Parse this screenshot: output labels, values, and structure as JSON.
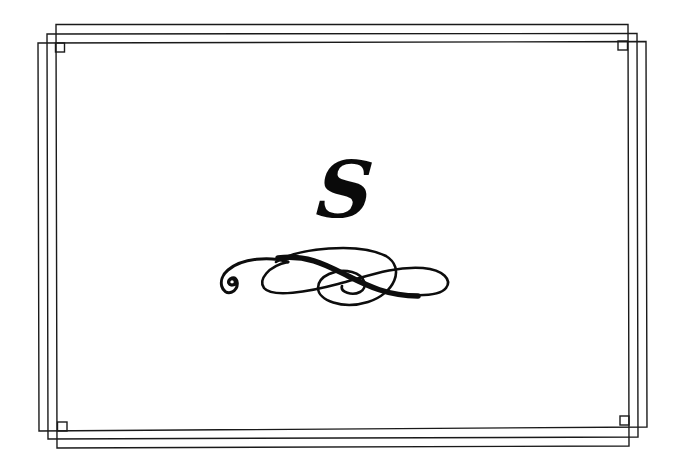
{
  "page": {
    "section_letter": "S",
    "ink_color": "#111111",
    "background_color": "#ffffff"
  },
  "decorations": {
    "frame": "triple-offset-rectangle-border-with-corner-squares",
    "ornament": "calligraphic-swash-flourish"
  }
}
